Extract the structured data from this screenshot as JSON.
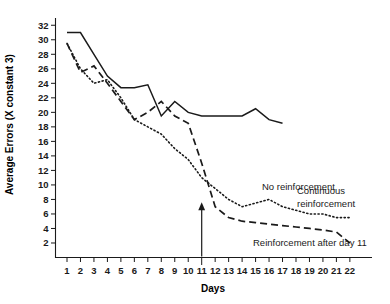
{
  "chart_data": {
    "type": "line",
    "title": "",
    "xlabel": "Days",
    "ylabel": "Average Errors (X constant 3)",
    "xlim": [
      0.4,
      22.8
    ],
    "ylim": [
      0,
      33
    ],
    "yticks": [
      2,
      4,
      6,
      8,
      10,
      12,
      14,
      16,
      18,
      20,
      22,
      24,
      26,
      28,
      30,
      32
    ],
    "xticks": [
      1,
      2,
      3,
      4,
      5,
      6,
      7,
      8,
      9,
      10,
      11,
      12,
      13,
      14,
      15,
      16,
      17,
      18,
      19,
      20,
      21,
      22
    ],
    "grid": false,
    "legend_position": "inline-annotations",
    "x": [
      1,
      2,
      3,
      4,
      5,
      6,
      7,
      8,
      9,
      10,
      11,
      12,
      13,
      14,
      15,
      16,
      17,
      18,
      19,
      20,
      21,
      22
    ],
    "series": [
      {
        "name": "No reinforcement",
        "style": "solid",
        "x": [
          1,
          2,
          3,
          4,
          5,
          6,
          7,
          8,
          9,
          10,
          11,
          12,
          13,
          14,
          15,
          16,
          17
        ],
        "values": [
          31,
          31,
          28,
          25,
          23.4,
          23.4,
          23.8,
          19.5,
          21.5,
          20,
          19.5,
          19.5,
          19.5,
          19.5,
          20.5,
          19,
          18.5
        ]
      },
      {
        "name": "Continuous reinforcement",
        "style": "dotted",
        "x": [
          1,
          2,
          3,
          4,
          5,
          6,
          7,
          8,
          9,
          10,
          11,
          12,
          13,
          14,
          15,
          16,
          17,
          18,
          19,
          20,
          21,
          22
        ],
        "values": [
          29.5,
          26,
          24,
          24.5,
          22,
          19,
          18,
          17,
          15,
          13.5,
          11,
          9.5,
          8,
          7,
          7.5,
          8,
          7,
          6.5,
          6,
          6,
          5.5,
          5.5
        ]
      },
      {
        "name": "Reinforcement after day 11",
        "style": "dashed",
        "x": [
          1,
          2,
          3,
          4,
          5,
          6,
          7,
          8,
          9,
          10,
          11,
          12,
          13,
          14,
          15,
          16,
          17,
          18,
          19,
          20,
          21,
          22
        ],
        "values": [
          29.5,
          25.5,
          26.4,
          24,
          21.5,
          19,
          20,
          21.5,
          19.5,
          18.5,
          13,
          7,
          5.5,
          5,
          4.8,
          4.6,
          4.4,
          4.2,
          4,
          3.8,
          3.5,
          2
        ]
      }
    ],
    "annotations": [
      {
        "name": "no-reinforcement-label",
        "text": "No reinforcement",
        "x": 17.8,
        "y": 19
      },
      {
        "name": "continuous-reinforcement-label",
        "text": "Continuous",
        "x": 19.4,
        "y": 11.2
      },
      {
        "name": "continuous-reinforcement-label-2",
        "text": "reinforcement",
        "x": 19.4,
        "y": 9.2
      },
      {
        "name": "reinforcement-after-day-11-label",
        "text": "Reinforcement after day 11",
        "x": 15.0,
        "y": 2.2
      },
      {
        "name": "treatment-arrow",
        "text": "",
        "x": 11,
        "y": 0,
        "y_top": 7.6
      }
    ]
  },
  "colors": {
    "ink": "#1a1a1a",
    "background": "#ffffff"
  }
}
